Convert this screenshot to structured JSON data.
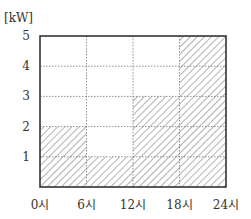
{
  "chart_data": {
    "type": "bar",
    "subtype": "step-area",
    "title": "",
    "ylabel": "[kW]",
    "xlabel": "",
    "x_edges": [
      0,
      6,
      12,
      18,
      24
    ],
    "x_tick_labels": [
      "0시",
      "6시",
      "12시",
      "18시",
      "24시"
    ],
    "y_ticks": [
      1,
      2,
      3,
      4,
      5
    ],
    "y_tick_labels": [
      "1",
      "2",
      "3",
      "4",
      "5"
    ],
    "xlim": [
      0,
      24
    ],
    "ylim": [
      0,
      5
    ],
    "grid": true,
    "categories": [
      "0시-6시",
      "6시-12시",
      "12시-18시",
      "18시-24시"
    ],
    "series": [
      {
        "name": "power",
        "values": [
          2,
          1,
          3,
          5
        ]
      }
    ],
    "fill": "diagonal-hatch",
    "colors": {
      "frame": "#333333",
      "grid": "#777777",
      "hatch": "#555555",
      "text": "#333333"
    }
  }
}
